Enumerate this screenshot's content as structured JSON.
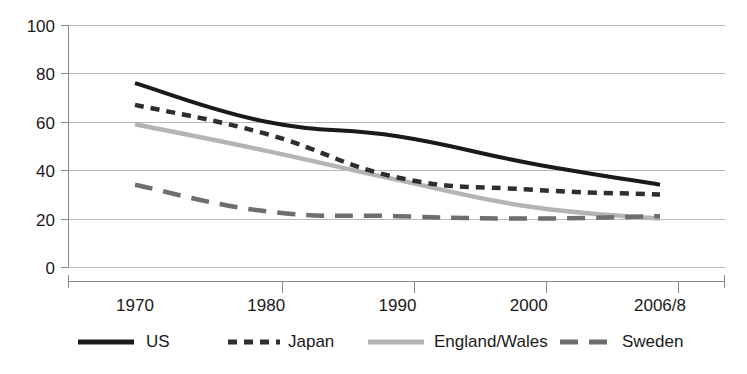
{
  "chart_data": {
    "type": "line",
    "title": "",
    "subtitle": "",
    "xlabel": "",
    "ylabel": "",
    "x": [
      "1970",
      "1980",
      "1990",
      "2000",
      "2006/8"
    ],
    "categories": [
      "1970",
      "1980",
      "1990",
      "2000",
      "2006/8"
    ],
    "xlim": [
      0,
      4
    ],
    "ylim": [
      0,
      100
    ],
    "y_ticks": [
      0,
      20,
      40,
      60,
      80,
      100
    ],
    "x_ticks": [
      "1970",
      "1980",
      "1990",
      "2000",
      "2006/8"
    ],
    "grid": true,
    "grid_axis": "y",
    "legend_position": "bottom",
    "series": [
      {
        "name": "US",
        "values": [
          76,
          60,
          54,
          43,
          34
        ],
        "color": "#1a1a1a",
        "style": "solid",
        "width": 4,
        "dash": "none"
      },
      {
        "name": "Japan",
        "values": [
          67,
          55,
          37,
          32,
          30
        ],
        "color": "#2e2e2e",
        "style": "dashed",
        "width": 4.5,
        "dash": "9,7"
      },
      {
        "name": "England/Wales",
        "values": [
          59,
          48,
          36,
          25,
          20
        ],
        "color": "#b4b4b4",
        "style": "solid",
        "width": 4.5,
        "dash": "none"
      },
      {
        "name": "Sweden",
        "values": [
          34,
          23,
          21,
          20,
          21
        ],
        "color": "#6e6e6e",
        "style": "dashed",
        "width": 4.5,
        "dash": "18,11"
      }
    ]
  },
  "axes": {
    "y_tick_labels": [
      "100",
      "80",
      "60",
      "40",
      "20",
      "0"
    ],
    "x_tick_labels": [
      "1970",
      "1980",
      "1990",
      "2000",
      "2006/8"
    ]
  },
  "legend": {
    "items": [
      {
        "label": "US",
        "color": "#1a1a1a",
        "dash": "none",
        "width": 5
      },
      {
        "label": "Japan",
        "color": "#2e2e2e",
        "dash": "9,7",
        "width": 5
      },
      {
        "label": "England/Wales",
        "color": "#b4b4b4",
        "dash": "none",
        "width": 5
      },
      {
        "label": "Sweden",
        "color": "#6e6e6e",
        "dash": "18,11",
        "width": 5
      }
    ]
  },
  "colors": {
    "gridline": "#b9b9b9",
    "axis": "#8a8a8a",
    "text": "#1a1a1a",
    "background": "#ffffff"
  }
}
